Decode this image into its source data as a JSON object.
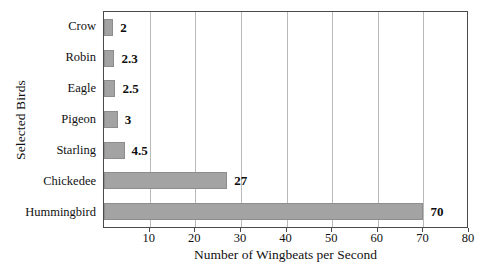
{
  "chart_data": {
    "type": "bar",
    "orientation": "horizontal",
    "title": "",
    "xlabel": "Number of Wingbeats per Second",
    "ylabel": "Selected Birds",
    "categories": [
      "Crow",
      "Robin",
      "Eagle",
      "Pigeon",
      "Starling",
      "Chickedee",
      "Hummingbird"
    ],
    "values": [
      2,
      2.3,
      2.5,
      3,
      4.5,
      27,
      70
    ],
    "value_labels": [
      "2",
      "2.3",
      "2.5",
      "3",
      "4.5",
      "27",
      "70"
    ],
    "xlim": [
      0,
      80
    ],
    "xticks": [
      10,
      20,
      30,
      40,
      50,
      60,
      70,
      80
    ],
    "xtick_labels": [
      "10",
      "20",
      "30",
      "40",
      "50",
      "60",
      "70",
      "80"
    ],
    "grid": true,
    "grid_axis": "x",
    "legend": null,
    "bar_color": "#a3a3a3",
    "bar_border_color": "#8d8d8d",
    "gridline_color": "#b9b9b9",
    "axis_color": "#4a4a4a",
    "background_color": "#ffffff"
  }
}
